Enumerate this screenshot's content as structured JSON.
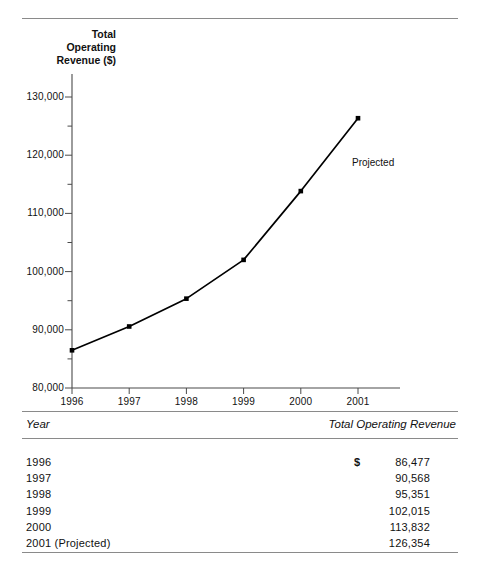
{
  "chart_data": {
    "type": "line",
    "title": "",
    "ylabel": "Total Operating Revenue ($)",
    "ylabel_lines": [
      "Total",
      "Operating",
      "Revenue ($)"
    ],
    "xlabel": "",
    "categories": [
      "1996",
      "1997",
      "1998",
      "1999",
      "2000",
      "2001"
    ],
    "x": [
      1996,
      1997,
      1998,
      1999,
      2000,
      2001
    ],
    "values": [
      86477,
      90568,
      95351,
      102015,
      113832,
      126354
    ],
    "series": [
      {
        "name": "Total Operating Revenue",
        "values": [
          86477,
          90568,
          95351,
          102015,
          113832,
          126354
        ]
      }
    ],
    "ylim": [
      80000,
      130000
    ],
    "ytick_labels": [
      "130,000",
      "120,000",
      "110,000",
      "100,000",
      "90,000",
      "80,000"
    ],
    "ytick_values": [
      130000,
      120000,
      110000,
      100000,
      90000,
      80000
    ],
    "yminor_step": 5000,
    "xtick_labels": [
      "1996",
      "1997",
      "1998",
      "1999",
      "2000",
      "2001"
    ],
    "grid": false,
    "legend": "none",
    "marker": "filled-square",
    "line_color": "#000000",
    "annotations": [
      {
        "text": "Projected",
        "x": 2001,
        "y": 118500
      }
    ]
  },
  "table": {
    "columns": [
      "Year",
      "Total Operating Revenue"
    ],
    "rows": [
      {
        "year": "1996",
        "currency": "$",
        "revenue": "86,477"
      },
      {
        "year": "1997",
        "currency": "",
        "revenue": "90,568"
      },
      {
        "year": "1998",
        "currency": "",
        "revenue": "95,351"
      },
      {
        "year": "1999",
        "currency": "",
        "revenue": "102,015"
      },
      {
        "year": "2000",
        "currency": "",
        "revenue": "113,832"
      },
      {
        "year": "2001 (Projected)",
        "currency": "",
        "revenue": "126,354"
      }
    ]
  }
}
